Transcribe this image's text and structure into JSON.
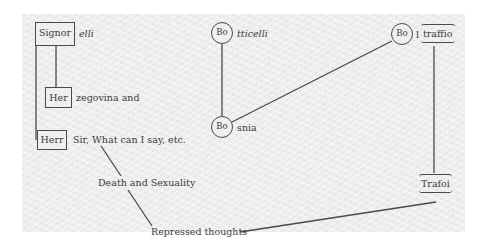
{
  "diagram": {
    "type": "freudian-signorelli-slip",
    "nodes": {
      "signor": {
        "box_label": "Signor",
        "suffix": "elli"
      },
      "her": {
        "box_label": "Her",
        "suffix": "zegovina and"
      },
      "herr": {
        "box_label": "Herr",
        "suffix": "Sir, What can I say, etc."
      },
      "death_sexuality": {
        "label": "Death and Sexuality"
      },
      "repressed": {
        "label": "Repressed thoughts"
      },
      "botticelli": {
        "circle_label": "Bo",
        "suffix": "tticelli"
      },
      "bosnia": {
        "circle_label": "Bo",
        "suffix": "snia"
      },
      "boltraffio": {
        "circle_label": "Bo",
        "mid": "l",
        "bracket_label": "traffio"
      },
      "trafoi": {
        "bracket_label": "Trafoi"
      }
    },
    "edges": [
      [
        "signor",
        "her"
      ],
      [
        "signor",
        "herr"
      ],
      [
        "herr",
        "death_sexuality"
      ],
      [
        "death_sexuality",
        "repressed"
      ],
      [
        "repressed",
        "trafoi"
      ],
      [
        "botticelli",
        "bosnia"
      ],
      [
        "bosnia",
        "boltraffio"
      ],
      [
        "boltraffio",
        "trafoi"
      ]
    ],
    "colors": {
      "line": "#4a4a4a",
      "text": "#3c3c3c",
      "paper": "#ededed"
    }
  }
}
